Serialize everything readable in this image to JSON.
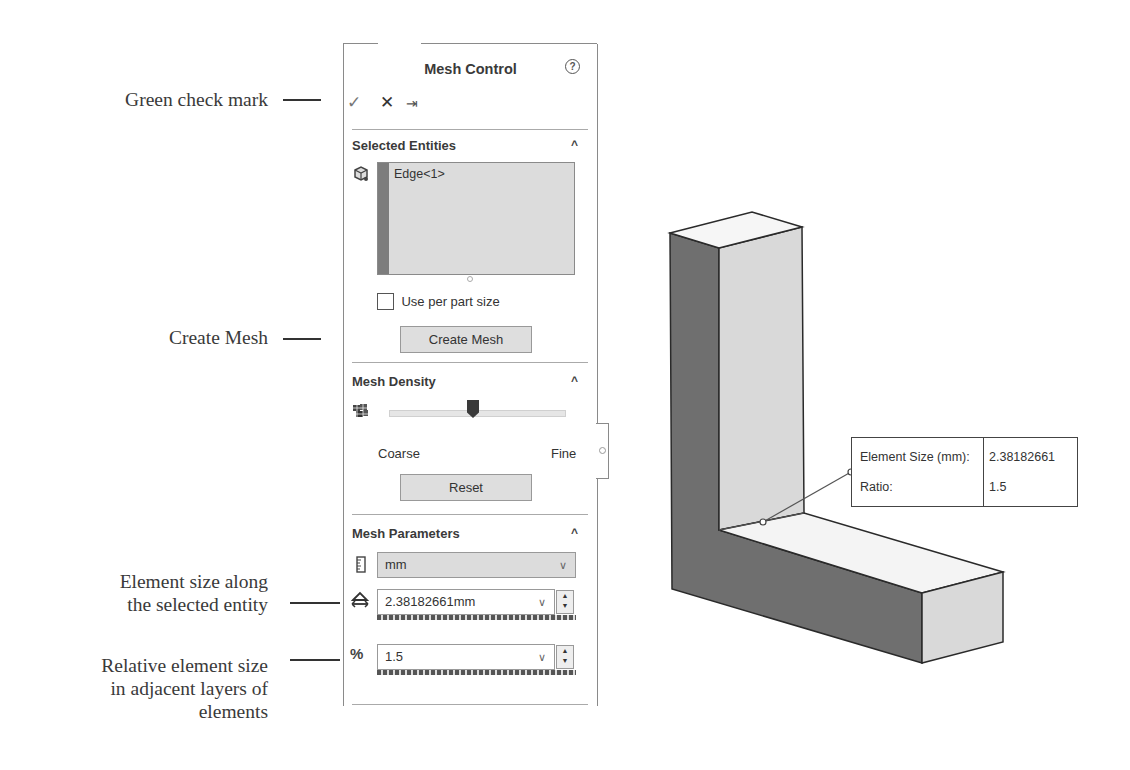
{
  "callouts": [
    {
      "id": "green-check",
      "text": "Green check mark"
    },
    {
      "id": "create-mesh",
      "text": "Create Mesh"
    },
    {
      "id": "element-size",
      "line1": "Element size along",
      "line2": "the selected entity"
    },
    {
      "id": "ratio",
      "line1": "Relative element size",
      "line2": "in adjacent layers of",
      "line3": "elements"
    }
  ],
  "panel": {
    "title": "Mesh Control",
    "help_icon": "?",
    "toolbar": {
      "ok": "✓",
      "cancel": "✕",
      "pin": "⇥"
    },
    "selected_entities": {
      "header": "Selected Entities",
      "items": [
        "Edge<1>"
      ],
      "use_per_part_size_label": "Use per part size",
      "use_per_part_size_checked": false,
      "create_mesh_label": "Create Mesh"
    },
    "mesh_density": {
      "header": "Mesh Density",
      "coarse_label": "Coarse",
      "fine_label": "Fine",
      "reset_label": "Reset",
      "slider_position_pct": 50
    },
    "mesh_parameters": {
      "header": "Mesh Parameters",
      "unit": "mm",
      "element_size": "2.38182661mm",
      "ratio": "1.5"
    }
  },
  "graphics": {
    "tooltip": {
      "rows": [
        {
          "key": "Element Size (mm):",
          "value": "2.38182661"
        },
        {
          "key": "Ratio:",
          "value": "1.5"
        }
      ]
    },
    "colors": {
      "dark_face": "#6f6f6f",
      "light_face": "#d9d9d9",
      "top_face": "#f6f6f6",
      "edge": "#2a2a2a"
    }
  }
}
